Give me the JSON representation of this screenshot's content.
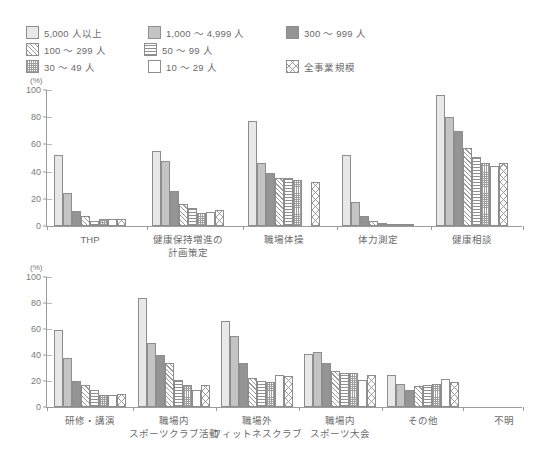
{
  "legend": {
    "items": [
      {
        "label": "5,000 人以上",
        "pattern": "p-s5000",
        "key": "s5000"
      },
      {
        "label": "1,000 〜 4,999 人",
        "pattern": "p-s1000",
        "key": "s1000"
      },
      {
        "label": "300 〜 999 人",
        "pattern": "p-s300",
        "key": "s300"
      },
      {
        "label": "100 〜 299 人",
        "pattern": "p-s100",
        "key": "s100"
      },
      {
        "label": "50 〜 99 人",
        "pattern": "p-s50",
        "key": "s50"
      },
      {
        "label": "30 〜 49 人",
        "pattern": "p-s30",
        "key": "s30"
      },
      {
        "label": "10 〜 29 人",
        "pattern": "p-s10",
        "key": "s10"
      },
      {
        "label": "全事業規模",
        "pattern": "p-sall",
        "key": "sall"
      }
    ]
  },
  "chart_data": [
    {
      "type": "bar",
      "title": "",
      "xlabel": "",
      "ylabel": "(%)",
      "ylim": [
        0,
        100
      ],
      "yticks": [
        0,
        20,
        40,
        60,
        80,
        100
      ],
      "ytick_labels": [
        "0",
        "20",
        "40",
        "60",
        "80",
        "100"
      ],
      "grid": false,
      "legend_position": "top",
      "categories": [
        "THP",
        "健康保持増進の\n計画策定",
        "職場体操",
        "体力測定",
        "健康相談"
      ],
      "category_lines": [
        [
          "THP"
        ],
        [
          "健康保持増進の",
          "計画策定"
        ],
        [
          "職場体操"
        ],
        [
          "体力測定"
        ],
        [
          "健康相談"
        ]
      ],
      "series": [
        {
          "name": "5,000 人以上",
          "pattern": "p-s5000",
          "values": [
            52,
            55.5,
            77,
            52,
            96
          ]
        },
        {
          "name": "1,000 〜 4,999 人",
          "pattern": "p-s1000",
          "values": [
            24,
            48,
            46,
            18,
            80
          ]
        },
        {
          "name": "300 〜 999 人",
          "pattern": "p-s300",
          "values": [
            11,
            25.5,
            39,
            7,
            70
          ]
        },
        {
          "name": "100 〜 299 人",
          "pattern": "p-s100",
          "values": [
            7,
            16.5,
            35,
            3.5,
            57
          ]
        },
        {
          "name": "50 〜 99 人",
          "pattern": "p-s50",
          "values": [
            4,
            13.5,
            35.5,
            2.5,
            51
          ]
        },
        {
          "name": "30 〜 49 人",
          "pattern": "p-s30",
          "values": [
            5,
            9.5,
            33.5,
            1.5,
            46
          ]
        },
        {
          "name": "10 〜 29 人",
          "pattern": "p-s10",
          "values": [
            5.5,
            10.5,
            0,
            1,
            44
          ]
        },
        {
          "name": "全事業規模",
          "pattern": "p-sall",
          "values": [
            5.5,
            11.5,
            32,
            1.5,
            46.5
          ]
        }
      ]
    },
    {
      "type": "bar",
      "title": "",
      "xlabel": "",
      "ylabel": "(%)",
      "ylim": [
        0,
        100
      ],
      "yticks": [
        0,
        20,
        40,
        60,
        80,
        100
      ],
      "ytick_labels": [
        "0",
        "20",
        "40",
        "60",
        "80",
        "100"
      ],
      "grid": false,
      "legend_position": "top",
      "categories": [
        "研修・講演",
        "職場内\nスポーツクラブ活動",
        "職場外\nフィットネスクラブ",
        "職場内\nスポーツ大会",
        "その他",
        "不明"
      ],
      "category_lines": [
        [
          "研修・講演"
        ],
        [
          "職場内",
          "スポーツクラブ活動"
        ],
        [
          "職場外",
          "フィットネスクラブ"
        ],
        [
          "職場内",
          "スポーツ大会"
        ],
        [
          "その他"
        ],
        [
          "不明"
        ]
      ],
      "series": [
        {
          "name": "5,000 人以上",
          "pattern": "p-s5000",
          "values": [
            59,
            84,
            66,
            41,
            25,
            0
          ]
        },
        {
          "name": "1,000 〜 4,999 人",
          "pattern": "p-s1000",
          "values": [
            38,
            49,
            55,
            42.5,
            18,
            0
          ]
        },
        {
          "name": "300 〜 999 人",
          "pattern": "p-s300",
          "values": [
            20,
            40,
            34,
            34,
            13,
            0
          ]
        },
        {
          "name": "100 〜 299 人",
          "pattern": "p-s100",
          "values": [
            17,
            33.5,
            22,
            28,
            16,
            0
          ]
        },
        {
          "name": "50 〜 99 人",
          "pattern": "p-s50",
          "values": [
            13,
            21,
            20,
            26,
            17,
            0
          ]
        },
        {
          "name": "30 〜 49 人",
          "pattern": "p-s30",
          "values": [
            9,
            17,
            19,
            26,
            17.5,
            0
          ]
        },
        {
          "name": "10 〜 29 人",
          "pattern": "p-s10",
          "values": [
            9,
            13,
            25,
            21,
            21.5,
            0
          ]
        },
        {
          "name": "全事業規模",
          "pattern": "p-sall",
          "values": [
            10,
            17,
            23.5,
            25,
            19.5,
            0
          ]
        }
      ]
    }
  ]
}
